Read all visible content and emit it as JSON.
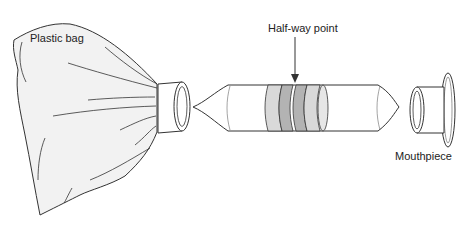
{
  "diagram": {
    "labels": {
      "plastic_bag": "Plastic bag",
      "half_way_point": "Half-way point",
      "mouthpiece": "Mouthpiece"
    },
    "components": [
      "plastic-bag",
      "bag-connector-ring",
      "tube",
      "mouthpiece"
    ],
    "colors": {
      "outline": "#333333",
      "bag_fill": "#f2f2f2",
      "band_light": "#d9d9d9",
      "band_dark": "#b3b3b3",
      "background": "#ffffff"
    }
  }
}
